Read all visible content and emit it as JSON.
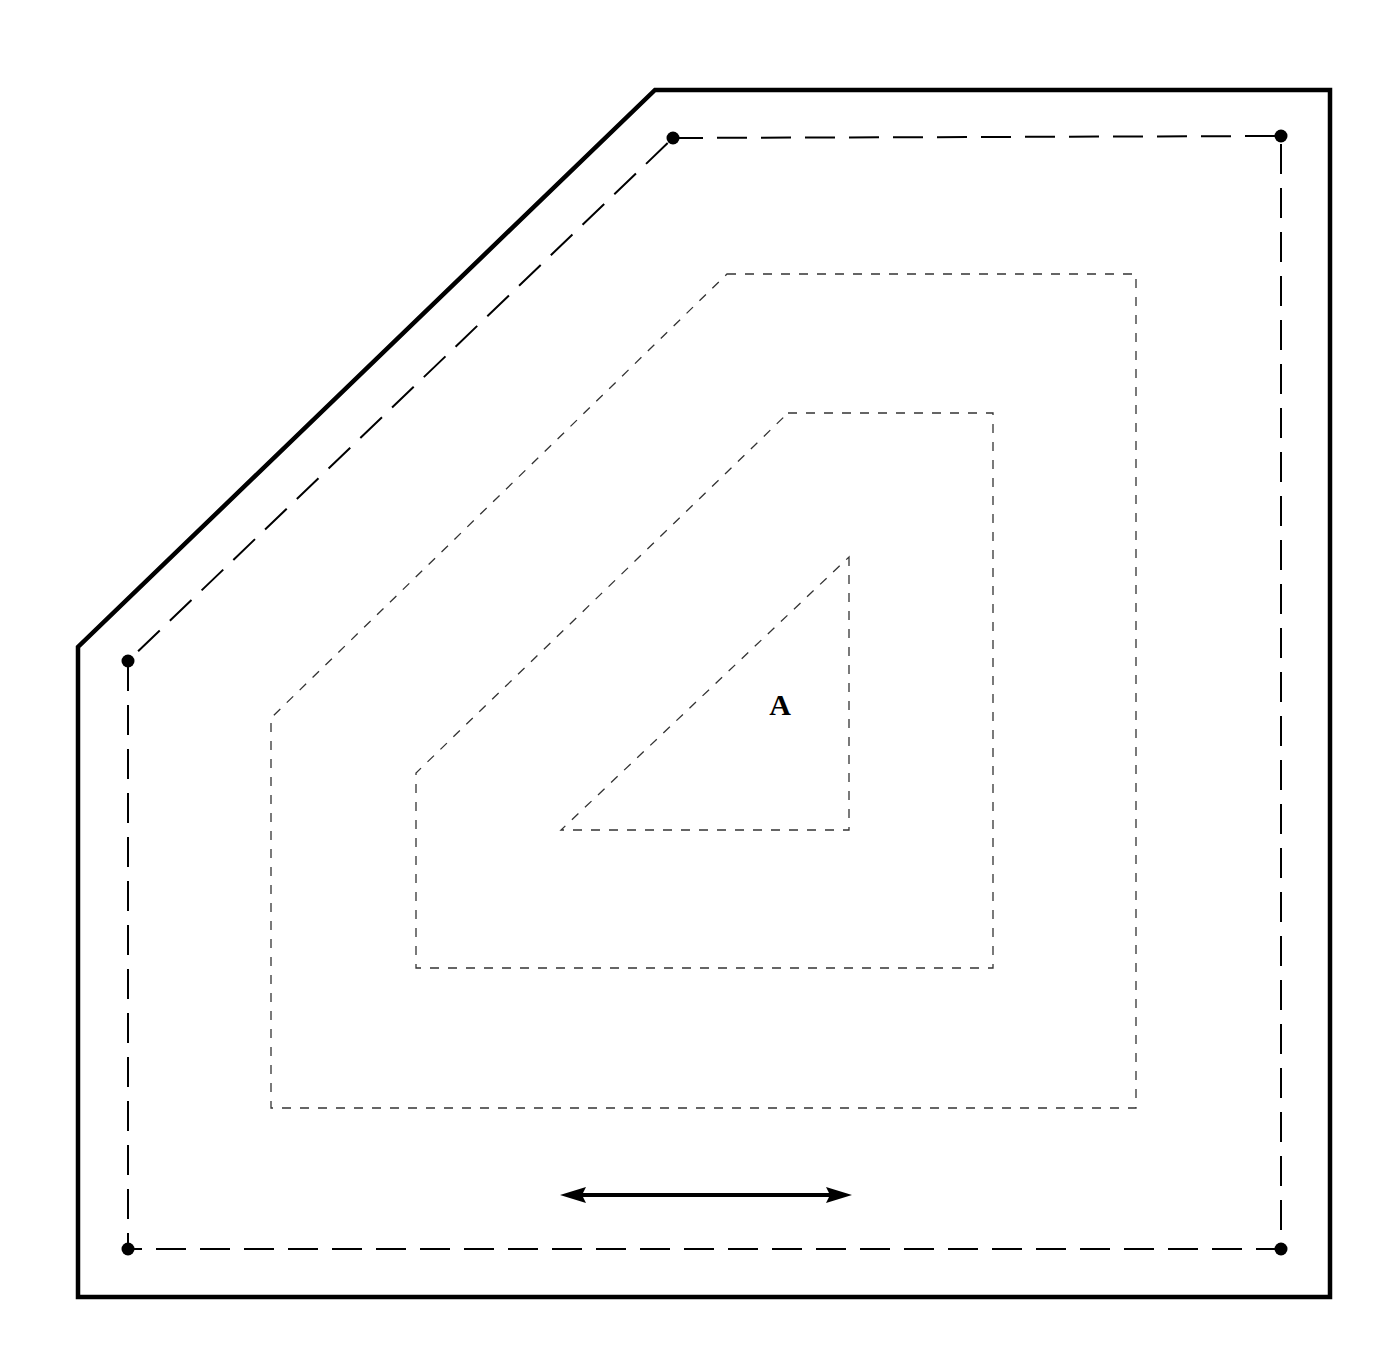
{
  "diagram": {
    "background": "#ffffff",
    "stroke_color": "#000000",
    "contour_color": "#333333",
    "outer_boundary": {
      "points": [
        [
          655,
          90
        ],
        [
          1330,
          90
        ],
        [
          1330,
          1297
        ],
        [
          78,
          1297
        ],
        [
          78,
          647
        ]
      ],
      "stroke_width": 4.5
    },
    "offset_line": {
      "points": [
        [
          673,
          138
        ],
        [
          1281,
          136
        ],
        [
          1281,
          1249
        ],
        [
          128,
          1249
        ],
        [
          128,
          661
        ]
      ],
      "dash": "30,14",
      "stroke_width": 2,
      "corner_dots": [
        [
          673,
          138
        ],
        [
          1281,
          136
        ],
        [
          1281,
          1249
        ],
        [
          128,
          1249
        ],
        [
          128,
          661
        ]
      ],
      "dot_radius": 6.5
    },
    "contours": [
      {
        "name": "contour-outer",
        "points": [
          [
            727,
            274
          ],
          [
            1136,
            274
          ],
          [
            1136,
            1108
          ],
          [
            271,
            1108
          ],
          [
            271,
            718
          ]
        ]
      },
      {
        "name": "contour-middle",
        "points": [
          [
            788,
            413
          ],
          [
            993,
            413
          ],
          [
            993,
            968
          ],
          [
            416,
            968
          ],
          [
            416,
            773
          ]
        ]
      },
      {
        "name": "contour-inner",
        "points": [
          [
            849,
            557
          ],
          [
            849,
            830
          ],
          [
            561,
            830
          ]
        ]
      }
    ],
    "contour_dash": "9,9",
    "contour_stroke_width": 1.3,
    "label": {
      "text": "A",
      "x": 780,
      "y": 715,
      "font_size": 30
    },
    "arrow": {
      "x1": 560,
      "x2": 852,
      "y": 1195,
      "stroke_width": 4,
      "direction": "double-headed"
    }
  }
}
